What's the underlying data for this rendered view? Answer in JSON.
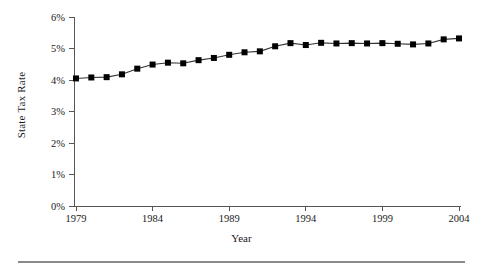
{
  "chart_data": {
    "type": "line",
    "title": "",
    "xlabel": "Year",
    "ylabel": "State Tax Rate",
    "x": [
      1979,
      1980,
      1981,
      1982,
      1983,
      1984,
      1985,
      1986,
      1987,
      1988,
      1989,
      1990,
      1991,
      1992,
      1993,
      1994,
      1995,
      1996,
      1997,
      1998,
      1999,
      2000,
      2001,
      2002,
      2003,
      2004
    ],
    "values": [
      4.05,
      4.08,
      4.09,
      4.18,
      4.36,
      4.49,
      4.55,
      4.53,
      4.63,
      4.7,
      4.8,
      4.88,
      4.91,
      5.07,
      5.17,
      5.11,
      5.18,
      5.16,
      5.17,
      5.16,
      5.17,
      5.15,
      5.13,
      5.16,
      5.29,
      5.32
    ],
    "ylim": [
      0,
      6
    ],
    "xlim": [
      1979,
      2004
    ],
    "ytick_labels": [
      "6%",
      "5%",
      "4%",
      "3%",
      "2%",
      "1%",
      "0%"
    ],
    "ytick_values": [
      6,
      5,
      4,
      3,
      2,
      1,
      0
    ],
    "xtick_labels": [
      "1979",
      "1984",
      "1989",
      "1994",
      "1999",
      "2004"
    ],
    "xtick_values": [
      1979,
      1984,
      1989,
      1994,
      1999,
      2004
    ],
    "grid": false,
    "legend": false,
    "marker": "square",
    "series_color": "#000000",
    "line_color": "#333333",
    "axis_color": "#555555"
  }
}
